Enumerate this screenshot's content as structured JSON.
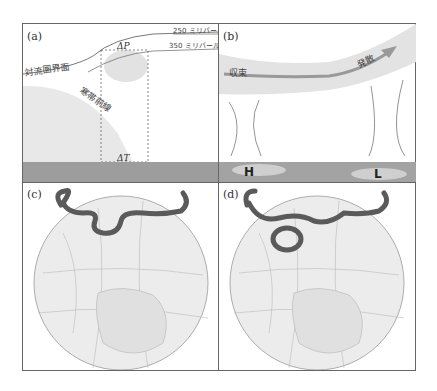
{
  "panels": {
    "a": {
      "label": "(a)",
      "texts": {
        "mb250": "250 ミリバール",
        "mb350": "350 ミリバール",
        "tropopause": "対流圏界面",
        "polar_front": "寒帯前線",
        "delta_p": "ΔP",
        "delta_t": "ΔT"
      }
    },
    "b": {
      "label": "(b)",
      "texts": {
        "convergence": "収束",
        "divergence": "発散",
        "high": "H",
        "low": "L"
      }
    },
    "c": {
      "label": "(c)"
    },
    "d": {
      "label": "(d)"
    }
  },
  "colors": {
    "frame": "#666666",
    "shade": "#e6e6e6",
    "ground": "#a3a3a3",
    "jet": "#5a5a5a",
    "globe": "#efefef"
  }
}
